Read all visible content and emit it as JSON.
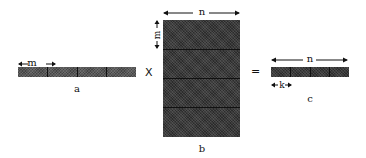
{
  "diagram": {
    "type": "matrix-multiplication",
    "matrix_a": {
      "label": "a",
      "dimension_label": "m",
      "blocks": 4
    },
    "matrix_b": {
      "label": "b",
      "width_label": "n",
      "height_label": "m",
      "row_blocks": 4
    },
    "matrix_c": {
      "label": "c",
      "width_label": "n",
      "block_label": "k",
      "blocks": 4
    },
    "operators": {
      "multiply": "X",
      "equals": "="
    }
  }
}
